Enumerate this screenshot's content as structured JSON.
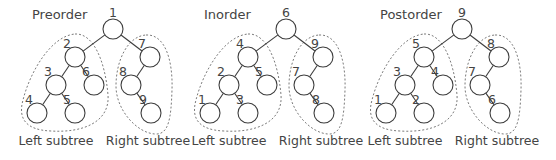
{
  "diagram": {
    "node_structure": {
      "root": "a",
      "children": {
        "a": [
          "b",
          "g"
        ],
        "b": [
          "c",
          "f"
        ],
        "c": [
          "d",
          "e"
        ],
        "g": [
          "h"
        ],
        "h": [
          "i"
        ]
      },
      "left_subtree": [
        "b",
        "c",
        "d",
        "e",
        "f"
      ],
      "right_subtree": [
        "g",
        "h",
        "i"
      ]
    },
    "trees": [
      {
        "id": "preorder",
        "title": "Preorder",
        "labels": {
          "a": "1",
          "b": "2",
          "c": "3",
          "d": "4",
          "e": "5",
          "f": "6",
          "g": "7",
          "h": "8",
          "i": "9"
        },
        "left_subtree_label": "Left subtree",
        "right_subtree_label": "Right subtree"
      },
      {
        "id": "inorder",
        "title": "Inorder",
        "labels": {
          "a": "6",
          "b": "4",
          "c": "2",
          "d": "1",
          "e": "3",
          "f": "5",
          "g": "9",
          "h": "7",
          "i": "8"
        },
        "left_subtree_label": "Left subtree",
        "right_subtree_label": "Right subtree"
      },
      {
        "id": "postorder",
        "title": "Postorder",
        "labels": {
          "a": "9",
          "b": "5",
          "c": "3",
          "d": "1",
          "e": "2",
          "f": "4",
          "g": "8",
          "h": "7",
          "i": "6"
        },
        "left_subtree_label": "Left subtree",
        "right_subtree_label": "Right subtree"
      }
    ]
  }
}
